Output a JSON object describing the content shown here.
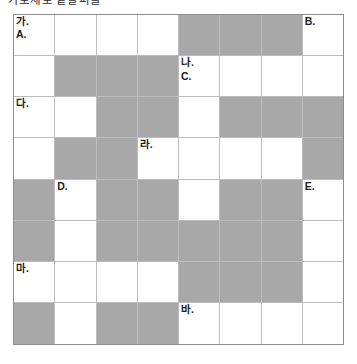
{
  "page": {
    "title_clipped": "가로세로 낱말퍼즐",
    "background_color": "#ffffff"
  },
  "grid": {
    "rows": 8,
    "columns": 8,
    "cell_white_color": "#ffffff",
    "cell_blocked_color": "#a8a8a8",
    "border_color": "#8c8c8c",
    "gridline_color": "#bdbdbd",
    "cells": [
      [
        {
          "blocked": false,
          "ko": "가.",
          "en": "A."
        },
        {
          "blocked": false,
          "ko": "",
          "en": ""
        },
        {
          "blocked": false,
          "ko": "",
          "en": ""
        },
        {
          "blocked": false,
          "ko": "",
          "en": ""
        },
        {
          "blocked": true,
          "ko": "",
          "en": ""
        },
        {
          "blocked": true,
          "ko": "",
          "en": ""
        },
        {
          "blocked": true,
          "ko": "",
          "en": ""
        },
        {
          "blocked": false,
          "ko": "",
          "en": "B."
        }
      ],
      [
        {
          "blocked": false,
          "ko": "",
          "en": ""
        },
        {
          "blocked": true,
          "ko": "",
          "en": ""
        },
        {
          "blocked": true,
          "ko": "",
          "en": ""
        },
        {
          "blocked": true,
          "ko": "",
          "en": ""
        },
        {
          "blocked": false,
          "ko": "나.",
          "en": "C."
        },
        {
          "blocked": false,
          "ko": "",
          "en": ""
        },
        {
          "blocked": false,
          "ko": "",
          "en": ""
        },
        {
          "blocked": false,
          "ko": "",
          "en": ""
        }
      ],
      [
        {
          "blocked": false,
          "ko": "다.",
          "en": ""
        },
        {
          "blocked": false,
          "ko": "",
          "en": ""
        },
        {
          "blocked": true,
          "ko": "",
          "en": ""
        },
        {
          "blocked": true,
          "ko": "",
          "en": ""
        },
        {
          "blocked": false,
          "ko": "",
          "en": ""
        },
        {
          "blocked": true,
          "ko": "",
          "en": ""
        },
        {
          "blocked": true,
          "ko": "",
          "en": ""
        },
        {
          "blocked": true,
          "ko": "",
          "en": ""
        }
      ],
      [
        {
          "blocked": false,
          "ko": "",
          "en": ""
        },
        {
          "blocked": true,
          "ko": "",
          "en": ""
        },
        {
          "blocked": true,
          "ko": "",
          "en": ""
        },
        {
          "blocked": false,
          "ko": "라.",
          "en": ""
        },
        {
          "blocked": false,
          "ko": "",
          "en": ""
        },
        {
          "blocked": false,
          "ko": "",
          "en": ""
        },
        {
          "blocked": false,
          "ko": "",
          "en": ""
        },
        {
          "blocked": true,
          "ko": "",
          "en": ""
        }
      ],
      [
        {
          "blocked": true,
          "ko": "",
          "en": ""
        },
        {
          "blocked": false,
          "ko": "",
          "en": "D."
        },
        {
          "blocked": true,
          "ko": "",
          "en": ""
        },
        {
          "blocked": true,
          "ko": "",
          "en": ""
        },
        {
          "blocked": false,
          "ko": "",
          "en": ""
        },
        {
          "blocked": true,
          "ko": "",
          "en": ""
        },
        {
          "blocked": true,
          "ko": "",
          "en": ""
        },
        {
          "blocked": false,
          "ko": "",
          "en": "E."
        }
      ],
      [
        {
          "blocked": true,
          "ko": "",
          "en": ""
        },
        {
          "blocked": false,
          "ko": "",
          "en": ""
        },
        {
          "blocked": true,
          "ko": "",
          "en": ""
        },
        {
          "blocked": true,
          "ko": "",
          "en": ""
        },
        {
          "blocked": true,
          "ko": "",
          "en": ""
        },
        {
          "blocked": true,
          "ko": "",
          "en": ""
        },
        {
          "blocked": true,
          "ko": "",
          "en": ""
        },
        {
          "blocked": false,
          "ko": "",
          "en": ""
        }
      ],
      [
        {
          "blocked": false,
          "ko": "마.",
          "en": ""
        },
        {
          "blocked": false,
          "ko": "",
          "en": ""
        },
        {
          "blocked": false,
          "ko": "",
          "en": ""
        },
        {
          "blocked": false,
          "ko": "",
          "en": ""
        },
        {
          "blocked": true,
          "ko": "",
          "en": ""
        },
        {
          "blocked": true,
          "ko": "",
          "en": ""
        },
        {
          "blocked": true,
          "ko": "",
          "en": ""
        },
        {
          "blocked": false,
          "ko": "",
          "en": ""
        }
      ],
      [
        {
          "blocked": true,
          "ko": "",
          "en": ""
        },
        {
          "blocked": false,
          "ko": "",
          "en": ""
        },
        {
          "blocked": true,
          "ko": "",
          "en": ""
        },
        {
          "blocked": true,
          "ko": "",
          "en": ""
        },
        {
          "blocked": false,
          "ko": "바.",
          "en": ""
        },
        {
          "blocked": false,
          "ko": "",
          "en": ""
        },
        {
          "blocked": false,
          "ko": "",
          "en": ""
        },
        {
          "blocked": false,
          "ko": "",
          "en": ""
        }
      ]
    ]
  }
}
